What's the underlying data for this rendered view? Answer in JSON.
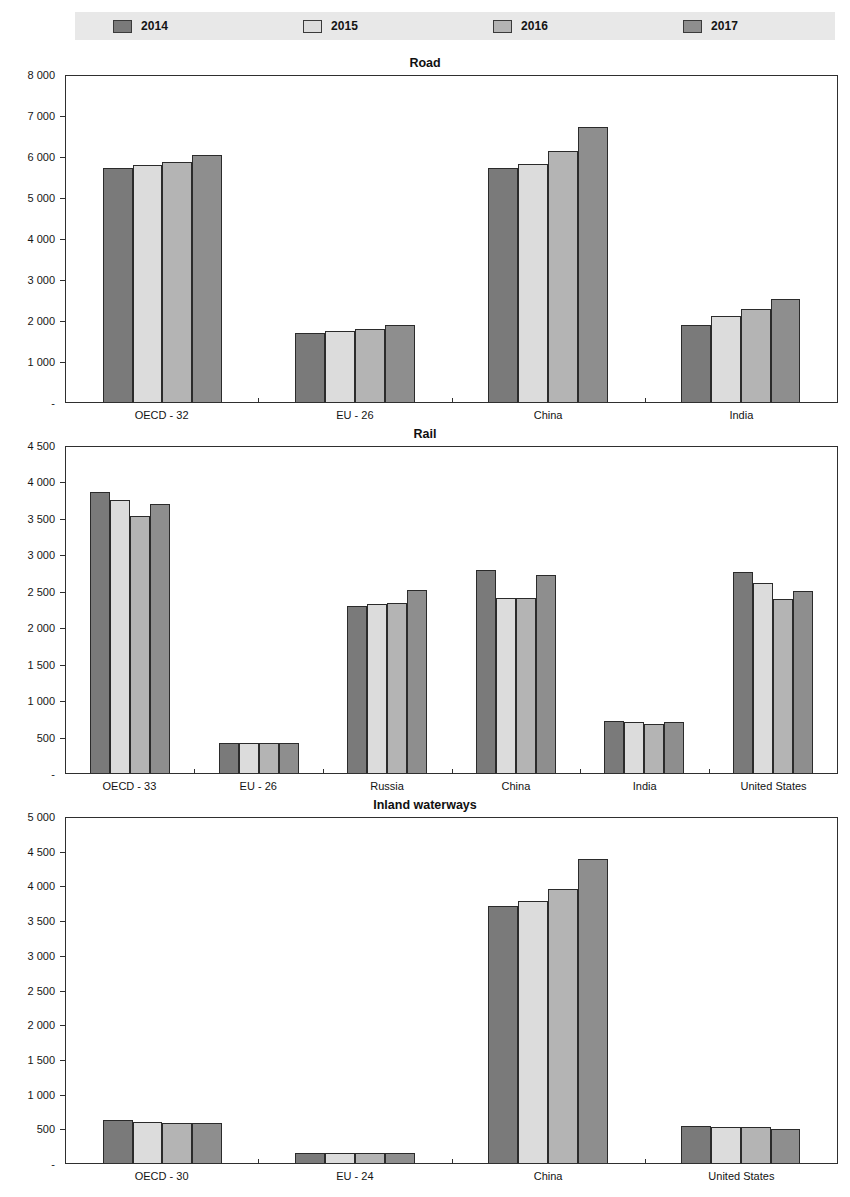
{
  "legend": {
    "items": [
      {
        "label": "2014",
        "color": "#7a7a7a"
      },
      {
        "label": "2015",
        "color": "#dcdcdc"
      },
      {
        "label": "2016",
        "color": "#b4b4b4"
      },
      {
        "label": "2017",
        "color": "#8e8e8e"
      }
    ],
    "background": "#e8e8e8"
  },
  "chart_data": [
    {
      "type": "bar",
      "title": "Road",
      "xlabel": "",
      "ylabel": "",
      "ylim": [
        0,
        8000
      ],
      "yticks": [
        0,
        1000,
        2000,
        3000,
        4000,
        5000,
        6000,
        7000,
        8000
      ],
      "ytick_labels": [
        "-",
        "1 000",
        "2 000",
        "3 000",
        "4 000",
        "5 000",
        "6 000",
        "7 000",
        "8 000"
      ],
      "grid": false,
      "legend_position": "top",
      "categories": [
        "OECD - 32",
        "EU - 26",
        "China",
        "India"
      ],
      "series": [
        {
          "name": "2014",
          "values": [
            5750,
            1690,
            5750,
            1900
          ]
        },
        {
          "name": "2015",
          "values": [
            5820,
            1740,
            5850,
            2100
          ]
        },
        {
          "name": "2016",
          "values": [
            5900,
            1800,
            6170,
            2290
          ]
        },
        {
          "name": "2017",
          "values": [
            6070,
            1890,
            6760,
            2540
          ]
        }
      ]
    },
    {
      "type": "bar",
      "title": "Rail",
      "xlabel": "",
      "ylabel": "",
      "ylim": [
        0,
        4500
      ],
      "yticks": [
        0,
        500,
        1000,
        1500,
        2000,
        2500,
        3000,
        3500,
        4000,
        4500
      ],
      "ytick_labels": [
        "-",
        "500",
        "1 000",
        "1 500",
        "2 000",
        "2 500",
        "3 000",
        "3 500",
        "4 000",
        "4 500"
      ],
      "grid": false,
      "legend_position": "top",
      "categories": [
        "OECD - 33",
        "EU - 26",
        "Russia",
        "China",
        "India",
        "United States"
      ],
      "series": [
        {
          "name": "2014",
          "values": [
            3880,
            420,
            2300,
            2800,
            720,
            2780
          ]
        },
        {
          "name": "2015",
          "values": [
            3770,
            420,
            2330,
            2420,
            700,
            2620
          ]
        },
        {
          "name": "2016",
          "values": [
            3550,
            420,
            2350,
            2420,
            680,
            2400
          ]
        },
        {
          "name": "2017",
          "values": [
            3710,
            420,
            2520,
            2730,
            700,
            2510
          ]
        }
      ]
    },
    {
      "type": "bar",
      "title": "Inland waterways",
      "xlabel": "",
      "ylabel": "",
      "ylim": [
        0,
        5000
      ],
      "yticks": [
        0,
        500,
        1000,
        1500,
        2000,
        2500,
        3000,
        3500,
        4000,
        4500,
        5000
      ],
      "ytick_labels": [
        "-",
        "500",
        "1 000",
        "1 500",
        "2 000",
        "2 500",
        "3 000",
        "3 500",
        "4 000",
        "4 500",
        "5 000"
      ],
      "grid": false,
      "legend_position": "top",
      "categories": [
        "OECD - 30",
        "EU - 24",
        "China",
        "United States"
      ],
      "series": [
        {
          "name": "2014",
          "values": [
            620,
            150,
            3720,
            540
          ]
        },
        {
          "name": "2015",
          "values": [
            600,
            145,
            3800,
            520
          ]
        },
        {
          "name": "2016",
          "values": [
            575,
            145,
            3970,
            515
          ]
        },
        {
          "name": "2017",
          "values": [
            580,
            145,
            4410,
            495
          ]
        }
      ]
    }
  ]
}
